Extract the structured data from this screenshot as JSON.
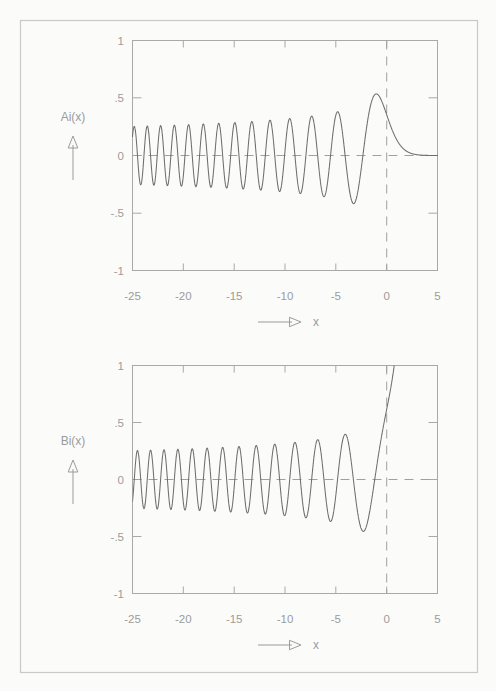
{
  "page": {
    "background_color": "#fbfbfa",
    "border_color": "#c9c9c9",
    "ink_color": "#8a8a8a",
    "curve_color": "#6e6e6e"
  },
  "chart_data": [
    {
      "type": "line",
      "id": "airy-ai",
      "title": "",
      "xlabel": "x",
      "ylabel": "Ai(x)",
      "xlim": [
        -25,
        5
      ],
      "ylim": [
        -1,
        1
      ],
      "xticks": [
        -25,
        -20,
        -15,
        -10,
        -5,
        0,
        5
      ],
      "xtick_labels": [
        "-25",
        "-20",
        "-15",
        "-10",
        "-5",
        "0",
        "5"
      ],
      "yticks": [
        -1,
        -0.5,
        0,
        0.5,
        1
      ],
      "ytick_labels": [
        "-1",
        "-.5",
        "0",
        ".5",
        "1"
      ],
      "grid": false,
      "legend": "none",
      "reference_lines": [
        {
          "axis": "y",
          "value": 0,
          "style": "dashed"
        },
        {
          "axis": "x",
          "value": 0,
          "style": "dashed"
        }
      ],
      "series": [
        {
          "name": "Ai(x)",
          "function": "airy_ai",
          "notes": "Oscillatory for x<0 with amplitude ~ pi^-1/2 |x|^-1/4; decays exponentially for x>0",
          "maximum": {
            "x": -1.02,
            "y": 0.5357
          },
          "value_at_zero": 0.355,
          "zeros": [
            -2.338,
            -4.088,
            -5.521,
            -6.787,
            -7.944,
            -9.023,
            -10.04,
            -11.009,
            -11.936,
            -12.829,
            -13.692,
            -14.528,
            -15.341,
            -16.133,
            -16.906,
            -17.661,
            -18.401,
            -19.126,
            -19.839,
            -20.539,
            -21.228,
            -21.906,
            -22.575,
            -23.234,
            -23.884,
            -24.526
          ]
        }
      ]
    },
    {
      "type": "line",
      "id": "airy-bi",
      "title": "",
      "xlabel": "x",
      "ylabel": "Bi(x)",
      "xlim": [
        -25,
        5
      ],
      "ylim": [
        -1,
        1
      ],
      "xticks": [
        -25,
        -20,
        -15,
        -10,
        -5,
        0,
        5
      ],
      "xtick_labels": [
        "-25",
        "-20",
        "-15",
        "-10",
        "-5",
        "0",
        "5"
      ],
      "yticks": [
        -1,
        -0.5,
        0,
        0.5,
        1
      ],
      "ytick_labels": [
        "-1",
        "-.5",
        "0",
        ".5",
        "1"
      ],
      "grid": false,
      "legend": "none",
      "reference_lines": [
        {
          "axis": "y",
          "value": 0,
          "style": "dashed"
        },
        {
          "axis": "x",
          "value": 0,
          "style": "dashed"
        }
      ],
      "series": [
        {
          "name": "Bi(x)",
          "function": "airy_bi",
          "notes": "Oscillatory for x<0 with amplitude ~ pi^-1/2 |x|^-1/4; grows without bound for x>0, exits top of frame near x=0.9",
          "value_at_zero": 0.6149,
          "zeros": [
            -1.174,
            -3.271,
            -4.83,
            -6.17,
            -7.376,
            -8.493,
            -9.539,
            -10.53,
            -11.475,
            -12.385,
            -13.262,
            -14.111,
            -14.936,
            -15.738,
            -16.521,
            -17.286,
            -18.034,
            -18.768,
            -19.488,
            -20.196,
            -20.892,
            -21.577,
            -22.252,
            -22.918,
            -23.575,
            -24.223,
            -24.862
          ]
        }
      ]
    }
  ],
  "panels": [
    {
      "key": "ai",
      "y_axis_label": "Ai(x)",
      "x_axis_label": "x",
      "y_tick_labels": [
        "1",
        ".5",
        "0",
        "-.5",
        "-1"
      ],
      "x_tick_labels": [
        "-25",
        "-20",
        "-15",
        "-10",
        "-5",
        "0",
        "5"
      ],
      "up_arrow_name": "y-axis-arrow",
      "right_arrow_name": "x-axis-arrow"
    },
    {
      "key": "bi",
      "y_axis_label": "Bi(x)",
      "x_axis_label": "x",
      "y_tick_labels": [
        "1",
        ".5",
        "0",
        "-.5",
        "-1"
      ],
      "x_tick_labels": [
        "-25",
        "-20",
        "-15",
        "-10",
        "-5",
        "0",
        "5"
      ],
      "up_arrow_name": "y-axis-arrow",
      "right_arrow_name": "x-axis-arrow"
    }
  ]
}
